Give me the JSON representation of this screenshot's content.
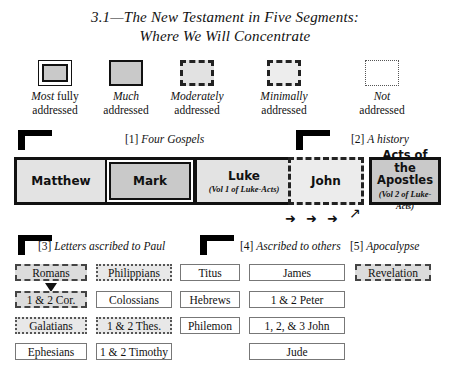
{
  "title": {
    "line1": "3.1—The New Testament in Five Segments:",
    "line2": "Where We Will Concentrate"
  },
  "legend": {
    "items": [
      {
        "id": "most-fully",
        "emphasis": "Most",
        "rest": " fully",
        "line2": "addressed",
        "style": "double-solid",
        "fill": "#c9c9c9"
      },
      {
        "id": "much",
        "emphasis": "Much",
        "rest": "",
        "line2": "addressed",
        "style": "solid",
        "fill": "#c9c9c9"
      },
      {
        "id": "moderately",
        "emphasis": "Moderately",
        "rest": "",
        "line2": "addressed",
        "style": "dashed",
        "fill": "#e2e2e2"
      },
      {
        "id": "minimally",
        "emphasis": "Minimally",
        "rest": "",
        "line2": "addressed",
        "style": "dashed",
        "fill": "#ededed"
      },
      {
        "id": "not",
        "emphasis": "Not",
        "rest": "",
        "line2": "addressed",
        "style": "dotted",
        "fill": "#ffffff"
      }
    ]
  },
  "segments": {
    "gospels": {
      "number": "[1]",
      "name": "Four Gospels"
    },
    "history": {
      "number": "[2]",
      "name": "A history"
    },
    "paul": {
      "number": "[3]",
      "name": "Letters ascribed to Paul"
    },
    "others": {
      "number": "[4]",
      "name": "Ascribed to others"
    },
    "apocalypse": {
      "number": "[5]",
      "name": "Apocalypse"
    }
  },
  "books": {
    "matthew": {
      "name": "Matthew",
      "sub": "",
      "coverage": "much"
    },
    "mark": {
      "name": "Mark",
      "sub": "",
      "coverage": "most-fully"
    },
    "luke": {
      "name": "Luke",
      "sub": "(Vol 1 of Luke-Acts)",
      "coverage": "much"
    },
    "john": {
      "name": "John",
      "sub": "",
      "coverage": "minimally"
    },
    "acts": {
      "name_line1": "Acts of the",
      "name_line2": "Apostles",
      "sub": "(Vol 2 of Luke-Acts)",
      "coverage": "much"
    }
  },
  "grid": {
    "columns": [
      {
        "id": "col-paul-1",
        "cells": [
          {
            "label": "Romans",
            "coverage": "moderately"
          },
          {
            "label": "1 & 2 Cor.",
            "coverage": "moderately"
          },
          {
            "label": "Galatians",
            "coverage": "minimally"
          },
          {
            "label": "Ephesians",
            "coverage": "not"
          }
        ]
      },
      {
        "id": "col-paul-2",
        "cells": [
          {
            "label": "Philippians",
            "coverage": "minimally"
          },
          {
            "label": "Colossians",
            "coverage": "not"
          },
          {
            "label": "1 & 2 Thes.",
            "coverage": "minimally"
          },
          {
            "label": "1 & 2 Timothy",
            "coverage": "not"
          }
        ]
      },
      {
        "id": "col-paul-3",
        "cells": [
          {
            "label": "Titus",
            "coverage": "not"
          },
          {
            "label": "Hebrews",
            "coverage": "not"
          },
          {
            "label": "Philemon",
            "coverage": "not"
          },
          {
            "label": "",
            "coverage": "none"
          }
        ]
      },
      {
        "id": "col-others",
        "cells": [
          {
            "label": "James",
            "coverage": "not"
          },
          {
            "label": "1 & 2 Peter",
            "coverage": "not"
          },
          {
            "label": "1, 2, & 3 John",
            "coverage": "not"
          },
          {
            "label": "Jude",
            "coverage": "not"
          }
        ]
      },
      {
        "id": "col-apocalypse",
        "cells": [
          {
            "label": "Revelation",
            "coverage": "moderately"
          },
          {
            "label": "",
            "coverage": "none"
          },
          {
            "label": "",
            "coverage": "none"
          },
          {
            "label": "",
            "coverage": "none"
          }
        ]
      }
    ]
  },
  "arrows": {
    "right_glyph": "➜",
    "ne_glyph": "↗",
    "romans_down": "▼"
  },
  "colors": {
    "ink": "#111111",
    "fill_dark": "#c9c9c9",
    "fill_mid": "#dcdcdc",
    "fill_light": "#ececec",
    "paper": "#ffffff"
  }
}
